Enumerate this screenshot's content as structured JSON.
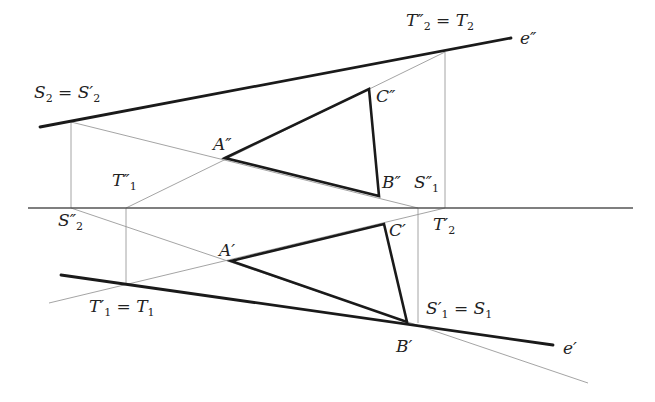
{
  "diagram": {
    "colors": {
      "thick": "#1a1a1a",
      "thin": "#9a9a9a",
      "axis": "#555555",
      "label": "#222222"
    },
    "axis": {
      "y": 208,
      "x1": 28,
      "x2": 633
    },
    "thick_lines": [
      {
        "name": "line-e-double-prime",
        "x1": 40,
        "y1": 127,
        "x2": 511,
        "y2": 38
      },
      {
        "name": "line-e-prime",
        "x1": 61,
        "y1": 275,
        "x2": 553,
        "y2": 345
      },
      {
        "name": "triangle-ABC-double-prime",
        "points": "225,158 369,89 379,196"
      },
      {
        "name": "triangle-ABC-prime",
        "points": "231,261 384,224 407,322"
      }
    ],
    "thin_lines": [
      {
        "name": "S2-to-S1dd",
        "x1": 71,
        "y1": 122,
        "x2": 418,
        "y2": 208
      },
      {
        "name": "T1dd-to-T2dd",
        "x1": 126,
        "y1": 208,
        "x2": 445,
        "y2": 52
      },
      {
        "name": "S2-recall",
        "x1": 71,
        "y1": 122,
        "x2": 71,
        "y2": 208
      },
      {
        "name": "T1-recall",
        "x1": 126,
        "y1": 208,
        "x2": 126,
        "y2": 284
      },
      {
        "name": "T2-recall",
        "x1": 445,
        "y1": 52,
        "x2": 445,
        "y2": 208
      },
      {
        "name": "S1-recall",
        "x1": 418,
        "y1": 208,
        "x2": 418,
        "y2": 323
      },
      {
        "name": "S2dd-to-S1",
        "x1": 71,
        "y1": 208,
        "x2": 588,
        "y2": 383
      },
      {
        "name": "T1-to-T2p",
        "x1": 49,
        "y1": 303,
        "x2": 445,
        "y2": 208
      }
    ],
    "labels": [
      {
        "name": "label-T2dd-eq-T2",
        "main": "T",
        "sup": "″",
        "sub": "2",
        "rest": " = T",
        "rest_sub": "2",
        "x": 406,
        "y": 12
      },
      {
        "name": "label-e-double-prime",
        "main": "e″",
        "x": 520,
        "y": 30
      },
      {
        "name": "label-S2-eq-S2p",
        "main": "S",
        "sub": "2",
        "rest": " = S′",
        "rest_sub": "2",
        "x": 34,
        "y": 84
      },
      {
        "name": "label-C-double-prime",
        "main": "C″",
        "x": 376,
        "y": 88
      },
      {
        "name": "label-A-double-prime",
        "main": "A″",
        "x": 213,
        "y": 136
      },
      {
        "name": "label-T1-double-prime",
        "main": "T″",
        "sub": "1",
        "x": 112,
        "y": 172
      },
      {
        "name": "label-B-double-prime",
        "main": "B″",
        "x": 382,
        "y": 174
      },
      {
        "name": "label-S1-double-prime",
        "main": "S″",
        "sub": "1",
        "x": 414,
        "y": 174
      },
      {
        "name": "label-S2-double-prime",
        "main": "S″",
        "sub": "2",
        "x": 58,
        "y": 212
      },
      {
        "name": "label-T2-prime",
        "main": "T′",
        "sub": "2",
        "x": 433,
        "y": 216
      },
      {
        "name": "label-C-prime",
        "main": "C′",
        "x": 389,
        "y": 222
      },
      {
        "name": "label-A-prime",
        "main": "A′",
        "x": 219,
        "y": 242
      },
      {
        "name": "label-T1p-eq-T1",
        "main": "T′",
        "sub": "1",
        "rest": " = T",
        "rest_sub": "1",
        "x": 89,
        "y": 298
      },
      {
        "name": "label-S1p-eq-S1",
        "main": "S′",
        "sub": "1",
        "rest": " = S",
        "rest_sub": "1",
        "x": 426,
        "y": 300
      },
      {
        "name": "label-B-prime",
        "main": "B′",
        "x": 396,
        "y": 338
      },
      {
        "name": "label-e-prime",
        "main": "e′",
        "x": 563,
        "y": 340
      }
    ]
  }
}
